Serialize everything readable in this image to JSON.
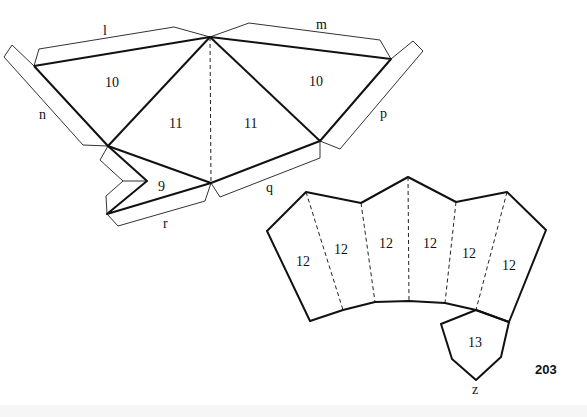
{
  "figure": {
    "type": "paper-model-net",
    "page_number": "203",
    "top_net": {
      "faces": [
        {
          "id": "face-10-left",
          "label": "10"
        },
        {
          "id": "face-11-left",
          "label": "11"
        },
        {
          "id": "face-11-right",
          "label": "11"
        },
        {
          "id": "face-10-right",
          "label": "10"
        },
        {
          "id": "face-9",
          "label": "9"
        }
      ],
      "flaps": [
        {
          "id": "flap-l",
          "label": "l"
        },
        {
          "id": "flap-m",
          "label": "m"
        },
        {
          "id": "flap-n",
          "label": "n"
        },
        {
          "id": "flap-p",
          "label": "p"
        },
        {
          "id": "flap-q",
          "label": "q"
        },
        {
          "id": "flap-r",
          "label": "r"
        }
      ]
    },
    "bottom_net": {
      "faces": [
        {
          "id": "face-12-a",
          "label": "12"
        },
        {
          "id": "face-12-b",
          "label": "12"
        },
        {
          "id": "face-12-c",
          "label": "12"
        },
        {
          "id": "face-12-d",
          "label": "12"
        },
        {
          "id": "face-12-e",
          "label": "12"
        },
        {
          "id": "face-12-f",
          "label": "12"
        },
        {
          "id": "face-13",
          "label": "13"
        }
      ],
      "tab_label": "z"
    }
  }
}
